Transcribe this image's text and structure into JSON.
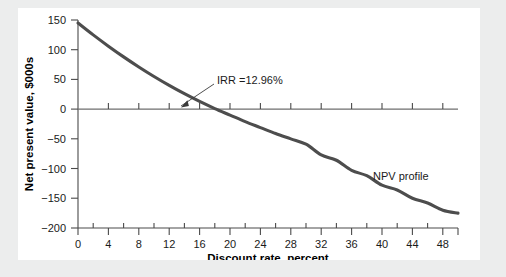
{
  "chart_data": {
    "type": "line",
    "title": "",
    "subtitle": "",
    "xlabel": "Discount rate, percent",
    "ylabel": "Net present value, $000s",
    "xlim": [
      0,
      50
    ],
    "ylim": [
      -200,
      150
    ],
    "grid": false,
    "legend_position": "inline-annotation",
    "x_ticks": [
      0,
      4,
      8,
      12,
      16,
      20,
      24,
      28,
      32,
      36,
      40,
      44,
      48
    ],
    "x_tick_labels": [
      "0",
      "4",
      "8",
      "12",
      "16",
      "20",
      "24",
      "28",
      "32",
      "36",
      "40",
      "44",
      "48"
    ],
    "x_minor_ticks": [
      2,
      6,
      10,
      14,
      18,
      22,
      26,
      30,
      34,
      38,
      42,
      46,
      50
    ],
    "y_ticks": [
      150,
      100,
      50,
      0,
      -50,
      -100,
      -150,
      -200
    ],
    "y_tick_labels": [
      "150",
      "100",
      "50",
      "0",
      "−50",
      "−100",
      "−150",
      "−200"
    ],
    "series": [
      {
        "name": "NPV profile",
        "x": [
          0,
          2,
          4,
          6,
          8,
          10,
          12,
          14,
          16,
          18,
          20,
          22,
          24,
          26,
          28,
          30,
          32,
          34,
          36,
          38,
          40,
          42,
          44,
          46,
          48,
          50
        ],
        "values": [
          145,
          125,
          106,
          88,
          71,
          55,
          40,
          26,
          13,
          1,
          -10,
          -21,
          -31,
          -41,
          -50,
          -59,
          -77,
          -86,
          -103,
          -112,
          -128,
          -136,
          -150,
          -158,
          -170,
          -175
        ]
      }
    ],
    "annotations": [
      {
        "name": "irr-annotation",
        "text": "IRR =12.96%",
        "value": 12.96,
        "points_to_x": 12.96,
        "points_to_y": 0
      },
      {
        "name": "series-inline-label",
        "text": "NPV profile",
        "at_x": 41,
        "at_y": -115
      }
    ],
    "colors": {
      "curve": "#4d4d4d",
      "axis": "#4a4a4a",
      "zero_line": "#6e6e6e",
      "background": "#ffffff",
      "page_background": "#eceded"
    }
  }
}
